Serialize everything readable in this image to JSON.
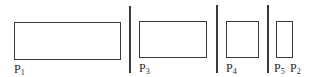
{
  "diagram": {
    "stroke_color": "#3a3a3a",
    "partitions": [
      {
        "id": "p1",
        "label": "P",
        "sub": "1",
        "rect": {
          "x": 14,
          "y": 22,
          "w": 107,
          "h": 38
        },
        "label_pos": {
          "x": 14,
          "y": 63
        }
      },
      {
        "id": "p3",
        "label": "P",
        "sub": "3",
        "rect": {
          "x": 139,
          "y": 21,
          "w": 68,
          "h": 37
        },
        "label_pos": {
          "x": 139,
          "y": 62
        }
      },
      {
        "id": "p4",
        "label": "P",
        "sub": "4",
        "rect": {
          "x": 226,
          "y": 21,
          "w": 33,
          "h": 37
        },
        "label_pos": {
          "x": 226,
          "y": 62
        }
      },
      {
        "id": "p2",
        "label": "P",
        "sub": "2",
        "rect": {
          "x": 276,
          "y": 21,
          "w": 17,
          "h": 37
        },
        "label_pos": {
          "x": 290,
          "y": 62
        }
      }
    ],
    "extra_labels": [
      {
        "id": "p5",
        "label": "P",
        "sub": "5",
        "label_pos": {
          "x": 274,
          "y": 62
        }
      }
    ],
    "dividers": [
      {
        "x": 129,
        "y1": 6,
        "y2": 73
      },
      {
        "x": 216,
        "y1": 5,
        "y2": 73
      },
      {
        "x": 267,
        "y1": 5,
        "y2": 73
      }
    ]
  }
}
